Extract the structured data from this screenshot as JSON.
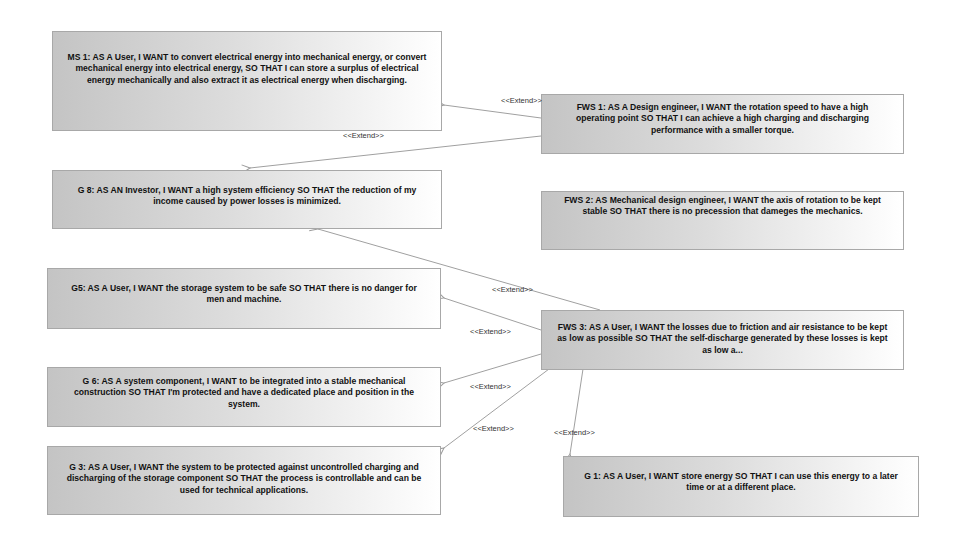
{
  "diagram": {
    "type": "use-case / user-story extend diagram",
    "stories": [
      {
        "id": "ms1",
        "text": "MS 1: AS A User, I WANT to convert electrical energy into mechanical energy, or convert mechanical energy into electrical energy, SO THAT I can store a surplus of electrical energy mechanically and also extract it as electrical energy when discharging."
      },
      {
        "id": "fws1",
        "text": "FWS 1: AS A Design engineer, I WANT the rotation speed to have a high operating point  SO THAT I can  achieve a high charging and discharging performance with a smaller torque."
      },
      {
        "id": "g8",
        "text": "G 8: AS AN Investor, I WANT a high system efficiency SO THAT the reduction of my income caused by power losses is minimized."
      },
      {
        "id": "fws2",
        "text": "FWS 2: AS Mechanical design engineer, I WANT the axis of rotation to be kept stable SO THAT there is no precession that dameges the mechanics."
      },
      {
        "id": "g5",
        "text": "G5: AS A User, I WANT the storage system to be safe  SO THAT there is no danger for men and machine."
      },
      {
        "id": "fws3",
        "text": "FWS 3: AS A User, I  WANT the losses due to friction and air resistance to be kept as low as possible SO THAT  the self-discharge generated by these losses is kept as low a..."
      },
      {
        "id": "g6",
        "text": "G 6: AS A system component, I WANT to be integrated into a stable mechanical construction SO THAT I'm protected and have a dedicated place and position in the system."
      },
      {
        "id": "g3",
        "text": "G 3: AS A  User, I WANT  the system to be protected against uncontrolled charging and discharging of the storage component SO THAT the process is controllable and can be used for technical applications."
      },
      {
        "id": "g1",
        "text": "G 1: AS A User, I WANT store energy SO THAT I can use this energy to a later time or at a different place."
      }
    ],
    "relations": [
      {
        "from": "fws1",
        "to": "ms1",
        "label": "<<Extend>>"
      },
      {
        "from": "fws1",
        "to": "g8",
        "label": "<<Extend>>"
      },
      {
        "from": "fws3",
        "to": "g8",
        "label": "<<Extend>>"
      },
      {
        "from": "fws3",
        "to": "g5",
        "label": "<<Extend>>"
      },
      {
        "from": "fws3",
        "to": "g6",
        "label": "<<Extend>>"
      },
      {
        "from": "fws3",
        "to": "g3",
        "label": "<<Extend>>"
      },
      {
        "from": "fws3",
        "to": "g1",
        "label": "<<Extend>>"
      }
    ],
    "colors": {
      "box_gradient_start": "#c4c4c4",
      "box_gradient_end": "#ffffff",
      "box_border": "#a8a8a8",
      "connector": "#9a9a9a",
      "text": "#111111"
    }
  }
}
